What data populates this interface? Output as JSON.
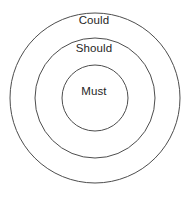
{
  "diagram": {
    "type": "concentric-circles",
    "background_color": "#ffffff",
    "stroke_color": "#4d4d4d",
    "fill_color": "#ffffff",
    "text_color": "#262626",
    "center": {
      "x": 95,
      "y": 98
    },
    "rings": [
      {
        "id": "could",
        "label": "Could",
        "radius": 85,
        "level": 3,
        "label_position": "top"
      },
      {
        "id": "should",
        "label": "Should",
        "radius": 60,
        "level": 2,
        "label_position": "top"
      },
      {
        "id": "must",
        "label": "Must",
        "radius": 33,
        "level": 1,
        "label_position": "center"
      }
    ]
  }
}
